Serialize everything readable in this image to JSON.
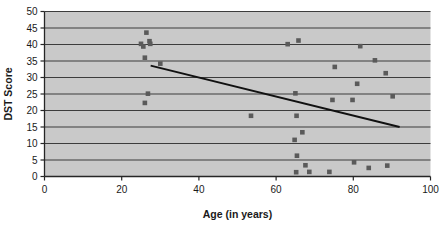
{
  "chart_data": {
    "type": "scatter",
    "title": "",
    "xlabel": "Age (in years)",
    "ylabel": "DST Score",
    "xlim": [
      0,
      100
    ],
    "ylim": [
      0,
      50
    ],
    "xticks": [
      0,
      20,
      40,
      60,
      80,
      100
    ],
    "yticks": [
      0,
      5,
      10,
      15,
      20,
      25,
      30,
      35,
      40,
      45,
      50
    ],
    "xtick_labels": [
      "0",
      "20",
      "40",
      "60",
      "80",
      "100"
    ],
    "ytick_labels": [
      "0",
      "5",
      "10",
      "15",
      "20",
      "25",
      "30",
      "35",
      "40",
      "45",
      "50"
    ],
    "grid": "horizontal",
    "legend": "none",
    "plot_bg_color": "#c9c9c9",
    "marker_color": "#5a5a5a",
    "marker_shape": "square",
    "line_color": "#111111",
    "grid_color": "#3c3c3c",
    "series": [
      {
        "name": "DST Score vs Age",
        "points": [
          [
            25.0,
            40.2
          ],
          [
            25.6,
            39.4
          ],
          [
            26.0,
            36.0
          ],
          [
            26.4,
            43.6
          ],
          [
            27.2,
            41.0
          ],
          [
            27.4,
            40.2
          ],
          [
            26.0,
            22.3
          ],
          [
            26.8,
            25.1
          ],
          [
            30.0,
            34.2
          ],
          [
            53.5,
            18.4
          ],
          [
            63.0,
            40.1
          ],
          [
            65.0,
            25.2
          ],
          [
            65.3,
            18.4
          ],
          [
            65.8,
            41.2
          ],
          [
            64.8,
            11.1
          ],
          [
            65.2,
            1.3
          ],
          [
            65.4,
            6.3
          ],
          [
            66.8,
            13.4
          ],
          [
            67.6,
            3.4
          ],
          [
            68.6,
            1.4
          ],
          [
            73.8,
            1.4
          ],
          [
            74.6,
            23.2
          ],
          [
            75.2,
            33.2
          ],
          [
            79.8,
            23.2
          ],
          [
            80.2,
            4.3
          ],
          [
            81.0,
            28.1
          ],
          [
            81.8,
            39.5
          ],
          [
            84.0,
            2.6
          ],
          [
            85.6,
            35.2
          ],
          [
            88.4,
            31.3
          ],
          [
            88.8,
            3.3
          ],
          [
            90.2,
            24.3
          ]
        ]
      }
    ],
    "trendline": {
      "name": "linear-fit",
      "x_start": 27.5,
      "y_start": 33.6,
      "x_end": 92.0,
      "y_end": 15.0
    }
  }
}
